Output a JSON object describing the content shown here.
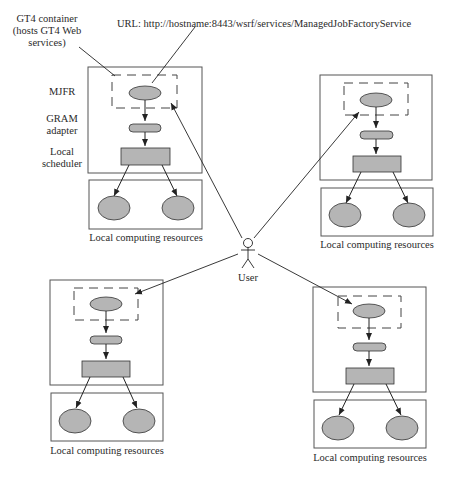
{
  "labels": {
    "container_note_1": "GT4 container",
    "container_note_2": "(hosts GT4 Web",
    "container_note_3": "services)",
    "url": "URL: http://hostname:8443/wsrf/services/ManagedJobFactoryService",
    "mjfr": "MJFR",
    "gram_1": "GRAM",
    "gram_2": "adapter",
    "sched_1": "Local",
    "sched_2": "scheduler",
    "user": "User"
  },
  "sites": [
    {
      "id": "top-left",
      "resources_label": "Local computing resources"
    },
    {
      "id": "top-right",
      "resources_label": "Local computing resources"
    },
    {
      "id": "bottom-left",
      "resources_label": "Local computing resources"
    },
    {
      "id": "bottom-right",
      "resources_label": "Local computing resources"
    }
  ],
  "colors": {
    "fill": "#b5b5b5",
    "stroke": "#333333",
    "box": "#555555"
  }
}
